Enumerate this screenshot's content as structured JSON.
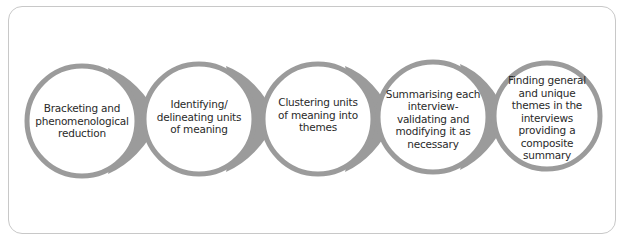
{
  "diagram": {
    "type": "process-flow",
    "direction": "left-to-right",
    "colors": {
      "ring": "#9b9b9b",
      "fill": "#ffffff",
      "text": "#2a2a2a",
      "frame": "#c8c8c8"
    },
    "steps": [
      {
        "label": "Bracketing and phenomenological reduction",
        "lines": [
          "Bracketing and",
          "phenomenological",
          "reduction"
        ]
      },
      {
        "label": "Identifying/ delineating units of meaning",
        "lines": [
          "Identifying/",
          "delineating units",
          "of meaning"
        ]
      },
      {
        "label": "Clustering units of meaning into themes",
        "lines": [
          "Clustering units",
          "of meaning into",
          "themes"
        ]
      },
      {
        "label": "Summarising each interview- validating and modifying it as necessary",
        "lines": [
          "Summarising each",
          "interview-",
          "validating and",
          "modifying it as",
          "necessary"
        ]
      },
      {
        "label": "Finding general and unique themes in the interviews providing a composite summary",
        "lines": [
          "Finding general",
          "and unique",
          "themes in the",
          "interviews",
          "providing a",
          "composite",
          "summary"
        ]
      }
    ]
  }
}
